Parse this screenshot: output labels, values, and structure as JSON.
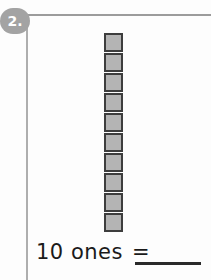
{
  "problem": {
    "number_label": "2.",
    "badge_color": "#a3a3a3",
    "badge_text_color": "#ffffff"
  },
  "manipulative": {
    "type": "base-ten-unit-cubes",
    "orientation": "vertical-column",
    "count": 10,
    "cube_fill_color": "#b4b4b4",
    "cube_border_color": "#3d3d3d",
    "cubes": [
      {
        "index": 1,
        "label": "unit-cube"
      },
      {
        "index": 2,
        "label": "unit-cube"
      },
      {
        "index": 3,
        "label": "unit-cube"
      },
      {
        "index": 4,
        "label": "unit-cube"
      },
      {
        "index": 5,
        "label": "unit-cube"
      },
      {
        "index": 6,
        "label": "unit-cube"
      },
      {
        "index": 7,
        "label": "unit-cube"
      },
      {
        "index": 8,
        "label": "unit-cube"
      },
      {
        "index": 9,
        "label": "unit-cube"
      },
      {
        "index": 10,
        "label": "unit-cube"
      }
    ]
  },
  "equation": {
    "quantity_text": "10 ones",
    "equals_sign": "=",
    "answer_value": "",
    "answer_placeholder": ""
  },
  "page": {
    "background_color": "#fdfdfd",
    "rule_color": "#9c9c9c"
  }
}
